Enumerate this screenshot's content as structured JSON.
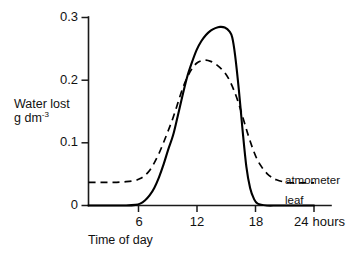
{
  "chart_data": {
    "type": "line",
    "title": "",
    "xlabel": "Time of day",
    "ylabel": "Water lost g dm",
    "ylabel_sup": "-3",
    "ylabel_line1": "Water lost",
    "ylabel_line2_base": "g dm",
    "xlim": [
      0,
      24
    ],
    "ylim": [
      0,
      0.3
    ],
    "grid": false,
    "legend_position": "right-inline",
    "x_unit_label": "hours",
    "yticks": [
      0,
      0.1,
      0.2,
      0.3
    ],
    "ytick_labels": [
      "0",
      "0.1",
      "0.2",
      "0.3"
    ],
    "xticks": [
      6,
      12,
      18,
      24
    ],
    "xtick_labels": [
      "6",
      "12",
      "18",
      "24"
    ],
    "series": [
      {
        "name": "leaf",
        "style": "solid",
        "color": "#000000",
        "x": [
          0,
          1,
          2,
          3,
          4,
          5,
          5.5,
          6,
          6.5,
          7,
          7.5,
          8,
          8.5,
          9,
          9.5,
          10,
          10.5,
          11,
          11.5,
          12,
          12.5,
          13,
          13.5,
          14,
          14.5,
          15,
          15.3,
          15.6,
          16,
          16.4,
          16.8,
          17.2,
          17.6,
          18,
          19,
          20,
          21,
          22,
          23,
          24
        ],
        "y": [
          0,
          0,
          0,
          0,
          0,
          0.001,
          0.003,
          0.008,
          0.016,
          0.028,
          0.045,
          0.066,
          0.09,
          0.112,
          0.143,
          0.175,
          0.205,
          0.228,
          0.248,
          0.262,
          0.272,
          0.279,
          0.283,
          0.285,
          0.284,
          0.278,
          0.268,
          0.24,
          0.185,
          0.12,
          0.062,
          0.028,
          0.011,
          0.003,
          0,
          0,
          0,
          0,
          0,
          0
        ]
      },
      {
        "name": "atmometer",
        "style": "dashed",
        "color": "#000000",
        "x": [
          0,
          1,
          2,
          3,
          4,
          5,
          5.5,
          6,
          6.5,
          7,
          7.5,
          8,
          8.5,
          9,
          9.5,
          10,
          10.5,
          11,
          11.5,
          12,
          12.5,
          13,
          13.5,
          14,
          14.5,
          15,
          15.5,
          16,
          16.5,
          17,
          17.5,
          18,
          18.5,
          19,
          19.5,
          20,
          21,
          22,
          23,
          24
        ],
        "y": [
          0.037,
          0.037,
          0.037,
          0.037,
          0.038,
          0.04,
          0.043,
          0.048,
          0.056,
          0.068,
          0.083,
          0.101,
          0.12,
          0.14,
          0.163,
          0.186,
          0.204,
          0.218,
          0.227,
          0.231,
          0.232,
          0.23,
          0.226,
          0.22,
          0.212,
          0.2,
          0.183,
          0.162,
          0.137,
          0.112,
          0.09,
          0.072,
          0.06,
          0.051,
          0.045,
          0.041,
          0.037,
          0.036,
          0.036,
          0.036
        ]
      }
    ],
    "annotations": [
      {
        "label": "atmometer",
        "series": "atmometer"
      },
      {
        "label": "leaf",
        "series": "leaf"
      }
    ]
  },
  "axes": {
    "y_tick_0": "0",
    "y_tick_1": "0.1",
    "y_tick_2": "0.2",
    "y_tick_3": "0.3",
    "x_tick_6": "6",
    "x_tick_12": "12",
    "x_tick_18": "18",
    "x_tick_24": "24",
    "x_unit": "hours",
    "x_axis_title": "Time of day",
    "y_axis_title_line1": "Water lost",
    "y_axis_title_line2": "g dm",
    "y_axis_title_exponent": "-3"
  },
  "legend": {
    "atmometer_label": "atmometer",
    "leaf_label": "leaf"
  }
}
